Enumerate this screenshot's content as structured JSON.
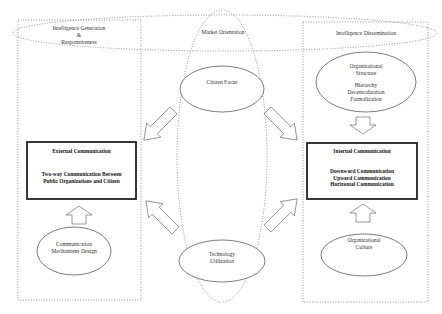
{
  "diagram": {
    "regions": {
      "top_band": {
        "label_left": [
          "Intelligence Generation",
          "&",
          "Responsiveness"
        ],
        "label_center": "Market Orientation",
        "label_right": "Intelligence Dissemination"
      }
    },
    "left_panel": {
      "external_box": {
        "title": "External Communication",
        "lines": [
          "Two-way Communication Between",
          "Public Organizations and Citizen"
        ]
      },
      "ellipse": {
        "lines": [
          "Communication",
          "Mechanisms Design"
        ]
      }
    },
    "center": {
      "top_ellipse": {
        "label": "Citizen Focus"
      },
      "bottom_ellipse": {
        "lines": [
          "Technology",
          "Utilization"
        ]
      }
    },
    "right_panel": {
      "internal_box": {
        "title": "Internal Communication",
        "lines": [
          "Downward Communication",
          "Upward Communication",
          "Horizontal Communication"
        ]
      },
      "top_ellipse": {
        "lines": [
          "Organizational",
          "Structure",
          "",
          "Hierarchy",
          "Decentralization",
          "Formalization"
        ]
      },
      "bottom_ellipse": {
        "lines": [
          "Organizational",
          "Culture"
        ]
      }
    },
    "colors": {
      "line": "#555555",
      "dotted": "#777777",
      "box_border": "#222222",
      "background": "#ffffff"
    }
  }
}
